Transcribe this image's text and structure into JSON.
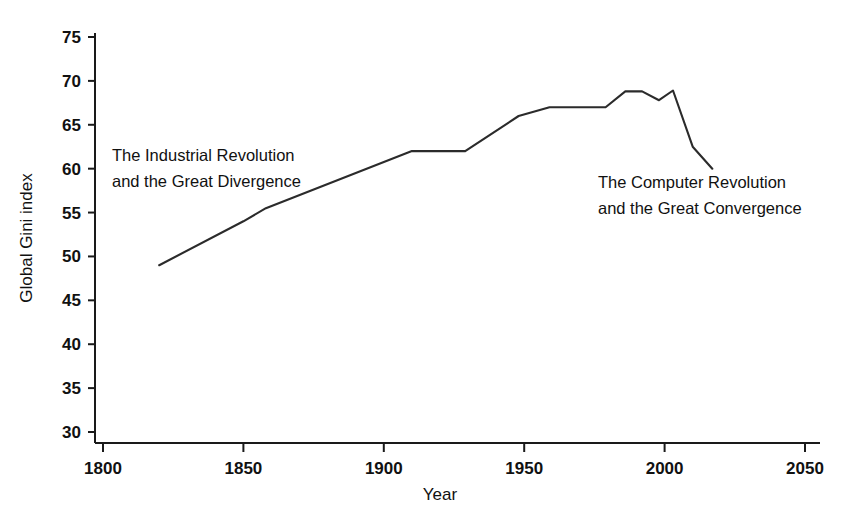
{
  "chart_data": {
    "type": "line",
    "title": "",
    "xlabel": "Year",
    "ylabel": "Global Gini index",
    "xlim": [
      1800,
      2050
    ],
    "ylim": [
      30,
      75
    ],
    "xticks": [
      1800,
      1850,
      1900,
      1950,
      2000,
      2050
    ],
    "xtick_labels": [
      "1800",
      "1850",
      "1900",
      "1950",
      "2000",
      "2050"
    ],
    "yticks": [
      30,
      35,
      40,
      45,
      50,
      55,
      60,
      65,
      70,
      75
    ],
    "ytick_labels": [
      "30",
      "35",
      "40",
      "45",
      "50",
      "55",
      "60",
      "65",
      "70",
      "75"
    ],
    "grid": false,
    "legend": false,
    "series": [
      {
        "name": "Global Gini index",
        "color": "#2b2b2b",
        "x": [
          1820,
          1850,
          1858,
          1910,
          1929,
          1948,
          1959,
          1979,
          1986,
          1992,
          1998,
          2003,
          2010,
          2017
        ],
        "y": [
          49.0,
          54.0,
          55.5,
          62.0,
          62.0,
          66.0,
          67.0,
          67.0,
          68.8,
          68.8,
          67.8,
          68.9,
          62.5,
          60.0
        ]
      }
    ],
    "annotations": [
      {
        "id": "industrial",
        "lines": [
          "The Industrial Revolution",
          "and the Great Divergence"
        ]
      },
      {
        "id": "computer",
        "lines": [
          "The Computer Revolution",
          "and the Great Convergence"
        ]
      }
    ]
  },
  "axes": {
    "x_title": "Year",
    "y_title": "Global Gini index"
  }
}
